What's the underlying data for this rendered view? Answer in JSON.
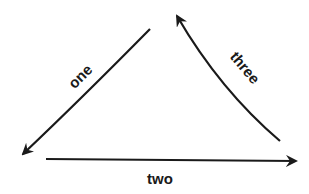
{
  "diagram": {
    "type": "cycle",
    "stroke_color": "#1a1a1a",
    "background": "#ffffff",
    "arrows": [
      {
        "id": "one",
        "label": "one",
        "from": "top",
        "to": "bottom-left",
        "shape": "curved"
      },
      {
        "id": "two",
        "label": "two",
        "from": "bottom-left",
        "to": "bottom-right",
        "shape": "straight"
      },
      {
        "id": "three",
        "label": "three",
        "from": "bottom-right",
        "to": "top",
        "shape": "curved"
      }
    ]
  }
}
